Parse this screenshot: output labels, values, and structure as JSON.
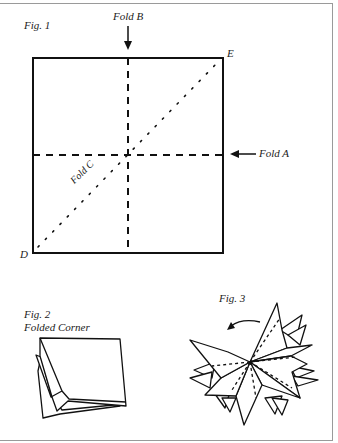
{
  "figures": {
    "fig1": {
      "title": "Fig. 1",
      "labels": {
        "fold_a": "Fold A",
        "fold_b": "Fold B",
        "fold_c": "Fold C",
        "corner_d": "D",
        "corner_e": "E"
      }
    },
    "fig2": {
      "title": "Fig. 2",
      "subtitle": "Folded Corner"
    },
    "fig3": {
      "title": "Fig. 3"
    }
  }
}
